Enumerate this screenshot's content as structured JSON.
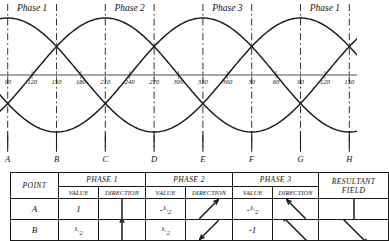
{
  "chart_data": {
    "type": "line",
    "xlabel": "",
    "ylabel": "",
    "xlim": [
      90,
      170
    ],
    "ylim": [
      -1,
      1
    ],
    "grid": false,
    "legend_position": "top-inline",
    "x_tick_labels": [
      "90",
      "120",
      "150",
      "180",
      "210",
      "240",
      "270",
      "300",
      "330",
      "360",
      "30",
      "60",
      "90",
      "120",
      "150"
    ],
    "x_tick_degrees": [
      90,
      120,
      150,
      180,
      210,
      240,
      270,
      300,
      330,
      360,
      390,
      420,
      450,
      480,
      510
    ],
    "point_labels": [
      "A",
      "B",
      "C",
      "D",
      "E",
      "F",
      "G",
      "H"
    ],
    "point_degrees": [
      90,
      150,
      210,
      270,
      330,
      390,
      450,
      510
    ],
    "sector_labels": [
      "Phase 1",
      "Phase 2",
      "Phase 3",
      "Phase 1"
    ],
    "sector_center_degrees": [
      120,
      240,
      360,
      480
    ],
    "series": [
      {
        "name": "Phase 1",
        "phase_offset_deg": 0,
        "amplitude": 1
      },
      {
        "name": "Phase 2",
        "phase_offset_deg": -120,
        "amplitude": 1
      },
      {
        "name": "Phase 3",
        "phase_offset_deg": -240,
        "amplitude": 1
      }
    ]
  },
  "table": {
    "headers": {
      "point": "POINT",
      "phase1": "PHASE 1",
      "phase2": "PHASE 2",
      "phase3": "PHASE 3",
      "resultant": "RESULTANT FIELD",
      "value": "VALUE",
      "direction": "DIRECTION"
    },
    "rows": [
      {
        "point": "A",
        "p1_value": "1",
        "p1_dir_deg": 0,
        "p1_dir_name": "arrow-up",
        "p2_value": "-1/2",
        "p2_dir_deg": 45,
        "p2_dir_name": "arrow-up-right",
        "p3_value": "-1/2",
        "p3_dir_deg": -45,
        "p3_dir_name": "arrow-up-left",
        "resultant_dir_deg": 180,
        "resultant_dir_name": "arrow-down"
      },
      {
        "point": "B",
        "p1_value": "1/2",
        "p1_dir_deg": 0,
        "p1_dir_name": "arrow-up",
        "p2_value": "1/2",
        "p2_dir_deg": 225,
        "p2_dir_name": "arrow-down-left",
        "p3_value": "-1",
        "p3_dir_deg": -45,
        "p3_dir_name": "arrow-up-left",
        "resultant_dir_deg": 135,
        "resultant_dir_name": "arrow-down-right"
      }
    ]
  },
  "colors": {
    "ink": "#1a1a1a",
    "axis": "#8a8a8a",
    "paper": "#ffffff"
  }
}
